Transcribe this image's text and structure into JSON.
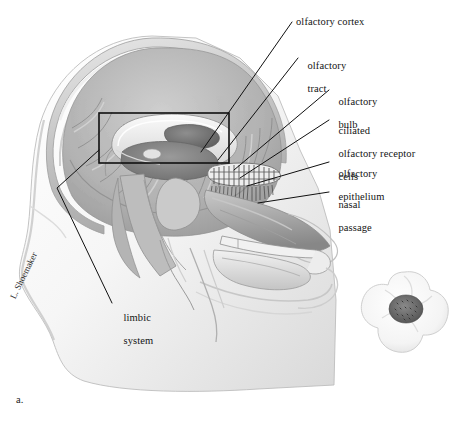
{
  "figure": {
    "id_label": "a.",
    "signature": "L. Shoemaker",
    "background_color": "#ffffff",
    "ink_color": "#141414"
  },
  "labels": [
    {
      "name": "olfactory-cortex",
      "lines": [
        "olfactory cortex"
      ],
      "x": 296,
      "y": 16
    },
    {
      "name": "olfactory-tract",
      "lines": [
        "olfactory",
        "tract"
      ],
      "x": 302,
      "y": 48
    },
    {
      "name": "olfactory-bulb",
      "lines": [
        "olfactory",
        "bulb"
      ],
      "x": 333,
      "y": 84
    },
    {
      "name": "ciliated-olfactory-receptor-cells",
      "lines": [
        "ciliated",
        "olfactory receptor",
        "cells"
      ],
      "x": 333,
      "y": 113
    },
    {
      "name": "olfactory-epithelium",
      "lines": [
        "olfactory",
        "epithelium"
      ],
      "x": 333,
      "y": 156
    },
    {
      "name": "nasal-passage",
      "lines": [
        "nasal",
        "passage"
      ],
      "x": 333,
      "y": 187
    },
    {
      "name": "limbic-system",
      "lines": [
        "limbic",
        "system"
      ],
      "x": 118,
      "y": 300
    }
  ],
  "leader_lines": [
    {
      "name": "leader-olfactory-cortex",
      "points": "292,22 201,152"
    },
    {
      "name": "leader-olfactory-tract",
      "points": "298,58 218,160"
    },
    {
      "name": "leader-olfactory-bulb",
      "points": "329,90 234,170"
    },
    {
      "name": "leader-ciliated-cells",
      "points": "329,120 240,178"
    },
    {
      "name": "leader-olfactory-epithelium",
      "points": "329,162 247,186"
    },
    {
      "name": "leader-nasal-passage",
      "points": "329,192 258,203"
    },
    {
      "name": "leader-limbic-system",
      "points": "99,150 57,188 112,303"
    }
  ],
  "callout_box": {
    "name": "limbic-system-highlight-box",
    "x": 99,
    "y": 113,
    "width": 130,
    "height": 50,
    "stroke": "#101010",
    "stroke_width": 1.6
  },
  "inset": {
    "name": "flower-inset",
    "description": "white flower with dark speckled center",
    "cx": 405,
    "cy": 312,
    "r": 40
  },
  "anatomy_parts": [
    "scalp",
    "skull",
    "cerebral-cortex",
    "corpus-callosum",
    "lateral-ventricle",
    "thalamus",
    "brainstem",
    "cerebellum",
    "olfactory-bulb",
    "cribriform-plate",
    "nasal-conchae",
    "nasal-passage",
    "hard-palate",
    "tongue",
    "mandible",
    "lips",
    "neck"
  ]
}
